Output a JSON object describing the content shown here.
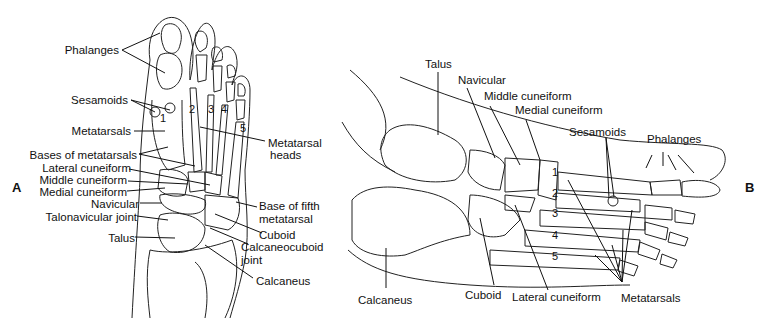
{
  "figure": {
    "panel_a": {
      "letter": "A",
      "labels_left": [
        "Phalanges",
        "Sesamoids",
        "Metatarsals",
        "Bases of metatarsals",
        "Lateral cuneiform",
        "Middle cuneiform",
        "Medial cuneiform",
        "Navicular",
        "Talonavicular joint",
        "Talus"
      ],
      "labels_right": [
        "Metatarsal",
        "heads",
        "Base of fifth",
        "metatarsal",
        "Cuboid",
        "Calcaneocuboid",
        "joint",
        "Calcaneus"
      ],
      "metatarsal_numbers": [
        "1",
        "2",
        "3",
        "4",
        "5"
      ]
    },
    "panel_b": {
      "letter": "B",
      "labels": [
        "Talus",
        "Navicular",
        "Middle cuneiform",
        "Medial cuneiform",
        "Sesamoids",
        "Phalanges",
        "Calcaneus",
        "Cuboid",
        "Lateral cuneiform",
        "Metatarsals"
      ],
      "metatarsal_numbers": [
        "1",
        "2",
        "3",
        "4",
        "5"
      ]
    }
  }
}
